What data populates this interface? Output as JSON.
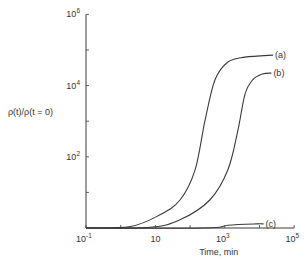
{
  "chart_data": {
    "type": "line",
    "title": "",
    "xlabel": "Time, min",
    "ylabel": "ρ(t)/ρ(t = 0)",
    "xscale": "log",
    "yscale": "log",
    "xlim": [
      0.1,
      100000
    ],
    "ylim": [
      1,
      1000000
    ],
    "grid": false,
    "x_tick_labels": [
      {
        "value": 0.1,
        "mantissa": "10",
        "exp": "-1"
      },
      {
        "value": 10,
        "mantissa": "10",
        "exp": ""
      },
      {
        "value": 1000,
        "mantissa": "10",
        "exp": "3"
      },
      {
        "value": 100000,
        "mantissa": "10",
        "exp": "5"
      }
    ],
    "y_tick_labels": [
      {
        "value": 100,
        "mantissa": "10",
        "exp": "2"
      },
      {
        "value": 10000,
        "mantissa": "10",
        "exp": "4"
      },
      {
        "value": 1000000,
        "mantissa": "10",
        "exp": "6"
      }
    ],
    "series": [
      {
        "name": "(a)",
        "points": [
          [
            0.1,
            1
          ],
          [
            1.9,
            1.1
          ],
          [
            13,
            2.3
          ],
          [
            51,
            6.1
          ],
          [
            139,
            43
          ],
          [
            270,
            1070
          ],
          [
            520,
            14400
          ],
          [
            1230,
            46000
          ],
          [
            3800,
            63000
          ],
          [
            24500,
            72000
          ]
        ]
      },
      {
        "name": "(b)",
        "points": [
          [
            0.1,
            1
          ],
          [
            7,
            1.05
          ],
          [
            51,
            1.7
          ],
          [
            370,
            6.1
          ],
          [
            1230,
            43
          ],
          [
            2400,
            570
          ],
          [
            3800,
            5600
          ],
          [
            6300,
            14400
          ],
          [
            12000,
            21000
          ],
          [
            22000,
            22500
          ]
        ]
      },
      {
        "name": "(c)",
        "points": [
          [
            0.1,
            1
          ],
          [
            270,
            1
          ],
          [
            1230,
            1.2
          ],
          [
            8000,
            1.3
          ],
          [
            13000,
            1.3
          ]
        ]
      }
    ]
  }
}
